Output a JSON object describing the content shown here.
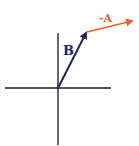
{
  "diagram": {
    "type": "vector-addition",
    "axes": {
      "color": "#1a1a1a"
    },
    "vectors": [
      {
        "name": "B",
        "label": "B",
        "color": "#1f2260",
        "from": [
          58,
          88
        ],
        "to": [
          87,
          32
        ]
      },
      {
        "name": "-A",
        "label": "-A",
        "color": "#e8622a",
        "from": [
          87,
          32
        ],
        "to": [
          134,
          20
        ]
      }
    ]
  }
}
